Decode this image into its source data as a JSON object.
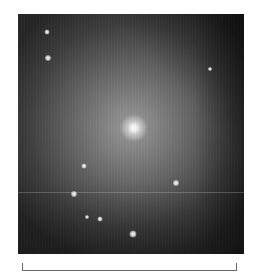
{
  "image": {
    "subject": "elliptical-galaxy",
    "frame": {
      "left": 18,
      "top": 14,
      "width": 226,
      "height": 240
    },
    "core": {
      "x": 135,
      "y": 128
    },
    "colors": {
      "background": "#ffffff",
      "core": "#ffffff",
      "halo": "#8a8a8a",
      "sky_dark": "#1e1e1e",
      "scale_bar": "#6a6a6a"
    },
    "artifact_line_y": 192,
    "stars": [
      {
        "x": 47,
        "y": 32,
        "size": 5
      },
      {
        "x": 48,
        "y": 58,
        "size": 6
      },
      {
        "x": 210,
        "y": 69,
        "size": 4
      },
      {
        "x": 84,
        "y": 166,
        "size": 5
      },
      {
        "x": 176,
        "y": 183,
        "size": 6
      },
      {
        "x": 74,
        "y": 194,
        "size": 6
      },
      {
        "x": 87,
        "y": 217,
        "size": 4
      },
      {
        "x": 100,
        "y": 219,
        "size": 5
      },
      {
        "x": 133,
        "y": 234,
        "size": 7
      }
    ]
  },
  "scale_bar": {
    "label": "",
    "x_start": 22,
    "x_end": 237,
    "y": 271
  }
}
